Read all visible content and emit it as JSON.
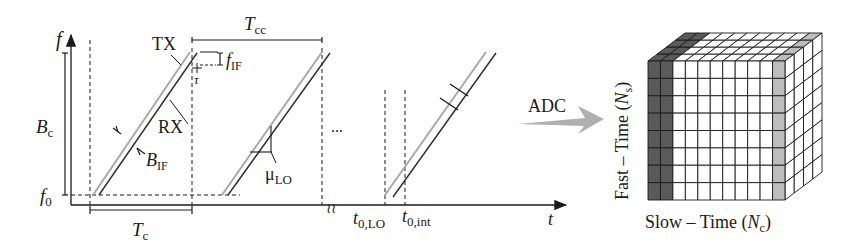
{
  "diagram": {
    "colors": {
      "ink": "#1a1a1a",
      "tx_line": "#a8a8a8",
      "rx_line": "#2b2b2b",
      "dark_cells": "#5a5a5a",
      "light_cells": "#bdbdbd",
      "arrow": "#b0b0b0"
    },
    "axes": {
      "y_label": "f",
      "x_label": "t",
      "f0_label": "f",
      "f0_sub": "0"
    },
    "labels": {
      "bandwidth": "B",
      "bandwidth_sub": "c",
      "tx": "TX",
      "rx": "RX",
      "if_bandwidth": "B",
      "if_bandwidth_sub": "IF",
      "f_if": "f",
      "f_if_sub": "IF",
      "tau": "τ",
      "chirp_duration": "T",
      "chirp_duration_sub": "c",
      "chirp_cycle": "T",
      "chirp_cycle_sub": "cc",
      "slope": "μ",
      "slope_sub": "LO",
      "ellipsis": "...",
      "t0_lo": "t",
      "t0_lo_sub": "0,LO",
      "t0_int": "t",
      "t0_int_sub": "0,int",
      "break_mark": "≀≀"
    },
    "conversion": {
      "label": "ADC"
    },
    "cube": {
      "fast_time_label": "Fast – Time (",
      "fast_time_var": "N",
      "fast_time_sub": "s",
      "slow_time_label": "Slow – Time (",
      "slow_time_var": "N",
      "slow_time_sub": "c",
      "close_paren": ")",
      "columns": 11,
      "rows": 8,
      "depth": 4,
      "dark_columns": 2,
      "light_columns": 1
    }
  }
}
